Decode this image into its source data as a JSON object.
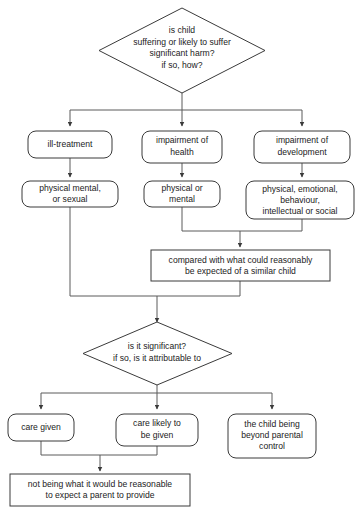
{
  "diagram": {
    "colors": {
      "background": "#ffffff",
      "node_fill": "#ffffff",
      "node_stroke": "#3a3a3a",
      "connector": "#5a5a5a",
      "text": "#222222"
    },
    "nodes": [
      {
        "id": "q1",
        "shape": "diamond",
        "lines": [
          "is child",
          "suffering or likely to suffer",
          "significant harm?",
          "if so, how?"
        ]
      },
      {
        "id": "cat1",
        "shape": "rounded-rect",
        "lines": [
          "ill-treatment"
        ]
      },
      {
        "id": "cat2",
        "shape": "rounded-rect",
        "lines": [
          "impairment of",
          "health"
        ]
      },
      {
        "id": "cat3",
        "shape": "rounded-rect",
        "lines": [
          "impairment of",
          "development"
        ]
      },
      {
        "id": "sub1",
        "shape": "rounded-rect",
        "lines": [
          "physical mental,",
          "or sexual"
        ]
      },
      {
        "id": "sub2",
        "shape": "rounded-rect",
        "lines": [
          "physical or",
          "mental"
        ]
      },
      {
        "id": "sub3",
        "shape": "rounded-rect",
        "lines": [
          "physical, emotional,",
          "behaviour,",
          "intellectual or social"
        ]
      },
      {
        "id": "compare",
        "shape": "rect",
        "lines": [
          "compared with what could reasonably",
          "be expected of a similar child"
        ]
      },
      {
        "id": "q2",
        "shape": "diamond",
        "lines": [
          "is it significant?",
          "if so, is it attributable to"
        ]
      },
      {
        "id": "out1",
        "shape": "rounded-rect",
        "lines": [
          "care given"
        ]
      },
      {
        "id": "out2",
        "shape": "rounded-rect",
        "lines": [
          "care likely to",
          "be given"
        ]
      },
      {
        "id": "out3",
        "shape": "rounded-rect",
        "lines": [
          "the child being",
          "beyond parental",
          "control"
        ]
      },
      {
        "id": "final",
        "shape": "rect",
        "lines": [
          "not being what it would be reasonable",
          "to expect a parent to provide"
        ]
      }
    ]
  }
}
